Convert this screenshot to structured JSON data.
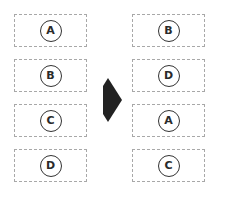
{
  "diagram": {
    "left_column": {
      "items": [
        {
          "label": "A"
        },
        {
          "label": "B"
        },
        {
          "label": "C"
        },
        {
          "label": "D"
        }
      ]
    },
    "arrow": {
      "icon": "right-arrow-icon",
      "color": "#222222"
    },
    "right_column": {
      "items": [
        {
          "label": "B"
        },
        {
          "label": "D"
        },
        {
          "label": "A"
        },
        {
          "label": "C"
        }
      ]
    }
  }
}
